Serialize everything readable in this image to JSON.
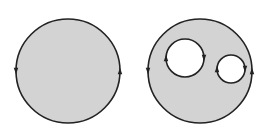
{
  "colors": {
    "fill": "#d3d3d3",
    "stroke": "#222222",
    "hole": "#ffffff",
    "background": "#ffffff"
  },
  "figures": [
    {
      "name": "simple-disk",
      "outer": {
        "cx": 68,
        "cy": 71,
        "r": 52,
        "orientation": "counterclockwise"
      },
      "holes": []
    },
    {
      "name": "disk-with-two-holes",
      "outer": {
        "cx": 200,
        "cy": 71,
        "r": 52,
        "orientation": "counterclockwise"
      },
      "holes": [
        {
          "cx": 185,
          "cy": 58,
          "r": 19,
          "orientation": "clockwise"
        },
        {
          "cx": 231,
          "cy": 69,
          "r": 14,
          "orientation": "clockwise"
        }
      ]
    }
  ]
}
